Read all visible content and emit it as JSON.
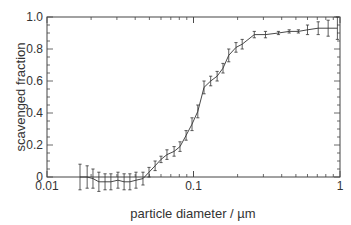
{
  "chart_data": {
    "type": "line",
    "title": "",
    "xlabel": "particle diameter / µm",
    "ylabel": "scavenged fraction",
    "xscale": "log",
    "xlim": [
      0.01,
      1
    ],
    "ylim": [
      0,
      1.0
    ],
    "grid": false,
    "legend": null,
    "x_tick_labels": [
      "0.01",
      "0.1",
      "1"
    ],
    "y_tick_labels": [
      "0",
      "0.2",
      "0.4",
      "0.6",
      "0.8",
      "1.0"
    ],
    "series": [
      {
        "name": "scavenged fraction",
        "error_bars": true,
        "x": [
          0.0168,
          0.0188,
          0.0206,
          0.0226,
          0.0249,
          0.0273,
          0.0305,
          0.0336,
          0.0368,
          0.0405,
          0.0452,
          0.0497,
          0.0547,
          0.06,
          0.0659,
          0.0737,
          0.0809,
          0.089,
          0.0977,
          0.107,
          0.118,
          0.131,
          0.145,
          0.159,
          0.174,
          0.195,
          0.215,
          0.26,
          0.31,
          0.38,
          0.45,
          0.52,
          0.6,
          0.71,
          0.83,
          0.96
        ],
        "y": [
          0.0,
          0.0,
          -0.01,
          -0.03,
          -0.03,
          -0.03,
          -0.02,
          -0.03,
          -0.03,
          -0.02,
          -0.01,
          0.03,
          0.07,
          0.11,
          0.14,
          0.16,
          0.19,
          0.26,
          0.33,
          0.41,
          0.56,
          0.6,
          0.63,
          0.68,
          0.76,
          0.81,
          0.83,
          0.89,
          0.89,
          0.9,
          0.91,
          0.91,
          0.92,
          0.93,
          0.93,
          0.93
        ],
        "err": [
          0.08,
          0.07,
          0.06,
          0.06,
          0.05,
          0.05,
          0.05,
          0.05,
          0.05,
          0.05,
          0.04,
          0.03,
          0.03,
          0.02,
          0.03,
          0.03,
          0.03,
          0.03,
          0.04,
          0.04,
          0.04,
          0.03,
          0.03,
          0.03,
          0.04,
          0.03,
          0.03,
          0.02,
          0.02,
          0.01,
          0.01,
          0.01,
          0.03,
          0.04,
          0.05,
          0.07
        ]
      }
    ]
  },
  "colors": {
    "line": "#333333",
    "axis": "#444444",
    "text": "#333333"
  }
}
